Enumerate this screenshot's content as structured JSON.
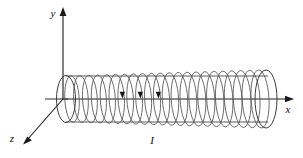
{
  "figure": {
    "background_color": "#ffffff",
    "line_color": "#555555",
    "axis_color": "#1a1a1a",
    "width": 303,
    "height": 158
  },
  "axes": {
    "origin": {
      "x": 63,
      "y": 99
    },
    "x_axis": {
      "label": "x",
      "label_pos": {
        "x": 288,
        "y": 110
      },
      "from": {
        "x": 63,
        "y": 99
      },
      "to": {
        "x": 293,
        "y": 99
      },
      "arrow": "right"
    },
    "y_axis": {
      "label": "y",
      "label_pos": {
        "x": 53,
        "y": 16
      },
      "from": {
        "x": 63,
        "y": 99
      },
      "to": {
        "x": 63,
        "y": 9
      },
      "arrow": "up"
    },
    "z_axis": {
      "label": "z",
      "label_pos": {
        "x": 10,
        "y": 142
      },
      "from": {
        "x": 63,
        "y": 99
      },
      "to": {
        "x": 24,
        "y": 143
      },
      "arrow": "down-left"
    }
  },
  "solenoid": {
    "current_label": "I",
    "current_label_pos": {
      "x": 152,
      "y": 141
    },
    "turn_count": 22,
    "left_end_x": 66,
    "right_end_x": 268,
    "center_y": 99,
    "radius_y": 29,
    "radius_x": 9,
    "body_top_y": 76,
    "body_bottom_y": 122,
    "current_arrow_turns": [
      5,
      7,
      9
    ],
    "current_direction": "down-front"
  },
  "stub": {
    "from": {
      "x": 45,
      "y": 99
    },
    "to": {
      "x": 66,
      "y": 99
    }
  }
}
